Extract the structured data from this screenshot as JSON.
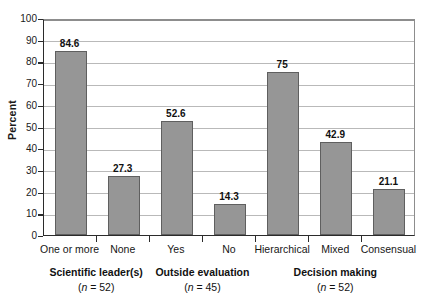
{
  "chart_data": {
    "type": "bar",
    "title": "",
    "xlabel": "",
    "ylabel": "Percent",
    "ylim": [
      0,
      100
    ],
    "ytick_step": 10,
    "grid": "horizontal",
    "legend": "none",
    "categories": [
      "One or more",
      "None",
      "Yes",
      "No",
      "Hierarchical",
      "Mixed",
      "Consensual"
    ],
    "values": [
      84.6,
      27.3,
      52.6,
      14.3,
      75,
      42.9,
      21.1
    ],
    "value_labels": [
      "84.6",
      "27.3",
      "52.6",
      "14.3",
      "75",
      "42.9",
      "21.1"
    ],
    "yticks": [
      "0",
      "10",
      "20",
      "30",
      "40",
      "50",
      "60",
      "70",
      "80",
      "90",
      "100"
    ],
    "bar_color": "#969696",
    "bar_border_color": "#5f5f5f",
    "axis_color": "#2b2b2b",
    "grid_color": "#b9b9b9",
    "groups": [
      {
        "name": "Scientific leader(s)",
        "n_label": "(n = 52)",
        "n_prefix": "(",
        "n_italic": "n",
        "n_suffix": " = 52)",
        "categories": [
          "One or more",
          "None"
        ]
      },
      {
        "name": "Outside evaluation",
        "n_label": "(n = 45)",
        "n_prefix": "(",
        "n_italic": "n",
        "n_suffix": " = 45)",
        "categories": [
          "Yes",
          "No"
        ]
      },
      {
        "name": "Decision making",
        "n_label": "(n = 52)",
        "n_prefix": "(",
        "n_italic": "n",
        "n_suffix": " = 52)",
        "categories": [
          "Hierarchical",
          "Mixed",
          "Consensual"
        ]
      }
    ]
  }
}
